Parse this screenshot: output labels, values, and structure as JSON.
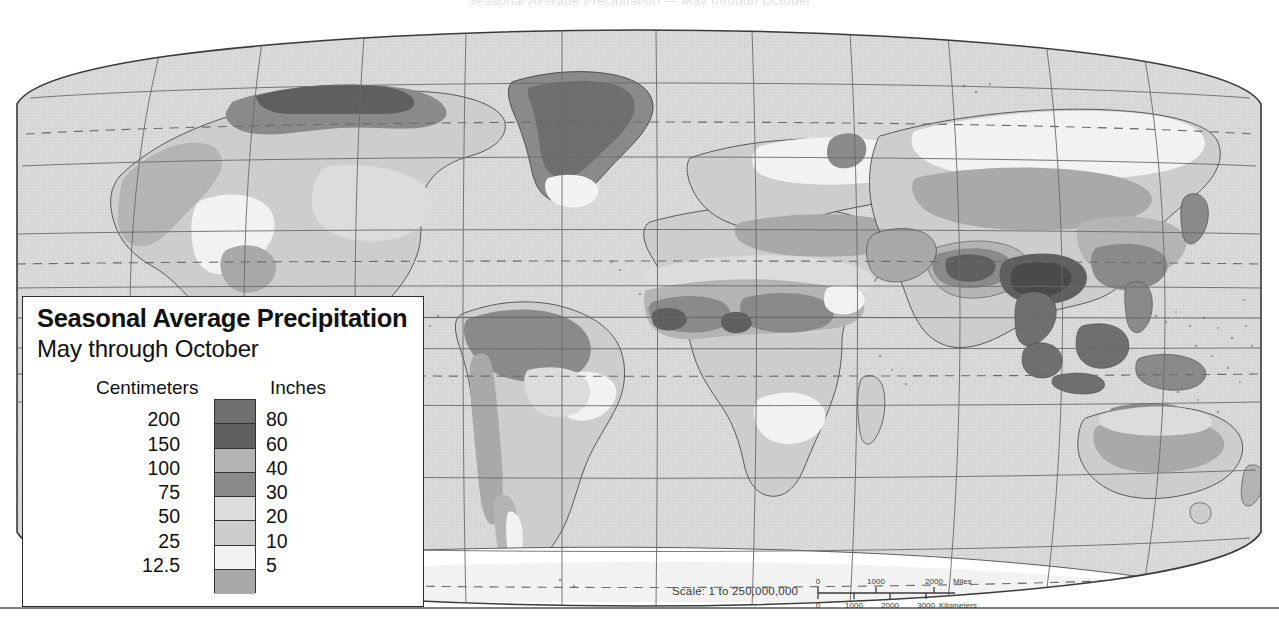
{
  "page": {
    "top_bleed_text": "Seasonal Average Precipitation — May through October"
  },
  "legend": {
    "title": "Seasonal Average Precipitation",
    "subtitle": "May through October",
    "header_left": "Centimeters",
    "header_right": "Inches",
    "boundaries": [
      {
        "cm": "200",
        "in": "80"
      },
      {
        "cm": "150",
        "in": "60"
      },
      {
        "cm": "100",
        "in": "40"
      },
      {
        "cm": "75",
        "in": "30"
      },
      {
        "cm": "50",
        "in": "20"
      },
      {
        "cm": "25",
        "in": "10"
      },
      {
        "cm": "12.5",
        "in": "5"
      }
    ],
    "swatches": [
      {
        "name": "over-200-cm",
        "color": "#6f6f6f"
      },
      {
        "name": "150-200-cm",
        "color": "#5f5f5f"
      },
      {
        "name": "100-150-cm",
        "color": "#b4b4b4"
      },
      {
        "name": "75-100-cm",
        "color": "#8a8a8a"
      },
      {
        "name": "50-75-cm",
        "color": "#dcdcdc"
      },
      {
        "name": "25-50-cm",
        "color": "#cdcdcd"
      },
      {
        "name": "12.5-25-cm",
        "color": "#f2f2f2"
      },
      {
        "name": "under-12.5-cm",
        "color": "#a9a9a9"
      }
    ]
  },
  "scale": {
    "statement": "Scale:  1 to 250,000,000",
    "miles_label": "Miles",
    "kilometers_label": "Kilometers",
    "miles_ticks": [
      "0",
      "1000",
      "2000"
    ],
    "kilometers_ticks": [
      "0",
      "1000",
      "2000",
      "3000"
    ]
  },
  "map": {
    "projection": "Robinson / elliptical world projection",
    "ocean_color": "#d8d8d8",
    "graticule_color": "#6a6a6a",
    "coastline_color": "#3a3a3a",
    "special_parallels": [
      "Arctic Circle",
      "Tropic of Cancer",
      "Tropic of Capricorn",
      "Antarctic Circle"
    ]
  },
  "chart_data": {
    "type": "map",
    "title": "Seasonal Average Precipitation",
    "subtitle": "May through October",
    "units_primary": "Centimeters",
    "units_secondary": "Inches",
    "class_breaks_cm": [
      12.5,
      25,
      50,
      75,
      100,
      150,
      200
    ],
    "class_breaks_in": [
      5,
      10,
      20,
      30,
      40,
      60,
      80
    ],
    "classes": [
      {
        "label": "over 200 cm / over 80 in",
        "cm_min": 200,
        "cm_max": null,
        "in_min": 80,
        "in_max": null,
        "color": "#6f6f6f"
      },
      {
        "label": "150-200 cm / 60-80 in",
        "cm_min": 150,
        "cm_max": 200,
        "in_min": 60,
        "in_max": 80,
        "color": "#5f5f5f"
      },
      {
        "label": "100-150 cm / 40-60 in",
        "cm_min": 100,
        "cm_max": 150,
        "in_min": 40,
        "in_max": 60,
        "color": "#b4b4b4"
      },
      {
        "label": "75-100 cm / 30-40 in",
        "cm_min": 75,
        "cm_max": 100,
        "in_min": 30,
        "in_max": 40,
        "color": "#8a8a8a"
      },
      {
        "label": "50-75 cm / 20-30 in",
        "cm_min": 50,
        "cm_max": 75,
        "in_min": 20,
        "in_max": 30,
        "color": "#dcdcdc"
      },
      {
        "label": "25-50 cm / 10-20 in",
        "cm_min": 25,
        "cm_max": 50,
        "in_min": 10,
        "in_max": 20,
        "color": "#cdcdcd"
      },
      {
        "label": "12.5-25 cm / 5-10 in",
        "cm_min": 12.5,
        "cm_max": 25,
        "in_min": 5,
        "in_max": 10,
        "color": "#f2f2f2"
      },
      {
        "label": "under 12.5 cm / under 5 in",
        "cm_min": 0,
        "cm_max": 12.5,
        "in_min": 0,
        "in_max": 5,
        "color": "#a9a9a9"
      }
    ],
    "scale_statement": "Scale:  1 to 250,000,000",
    "scale_miles_ticks": [
      0,
      1000,
      2000
    ],
    "scale_km_ticks": [
      0,
      1000,
      2000,
      3000
    ]
  }
}
